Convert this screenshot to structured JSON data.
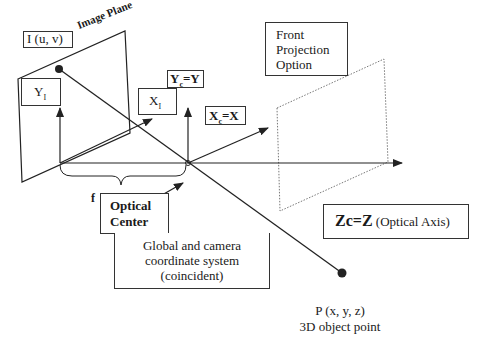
{
  "diagram": {
    "image_plane_label": "Image Plane",
    "image_point_label": "I (u, v)",
    "yi_label": "Y",
    "yi_sub": "I",
    "xi_label": "X",
    "xi_sub": "I",
    "yc_label": "Y",
    "yc_sub": "c",
    "yc_eq": "=Y",
    "xc_label": "X",
    "xc_sub": "c",
    "xc_eq": "=X",
    "f_label": "f",
    "optical_center_line1": "Optical",
    "optical_center_line2": "Center",
    "front_projection_line1": "Front",
    "front_projection_line2": "Projection",
    "front_projection_line3": "Option",
    "zc_label": "Zc=Z",
    "zc_desc": " (Optical Axis)",
    "coord_line1": "Global and camera",
    "coord_line2": "coordinate system",
    "coord_line3": "(coincident)",
    "object_point_line1": "P (x, y, z)",
    "object_point_line2": "3D object point"
  }
}
